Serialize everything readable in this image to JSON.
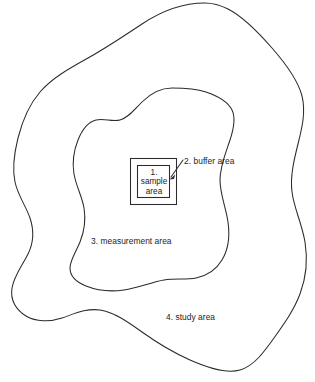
{
  "figure": {
    "type": "nested-areas-schematic",
    "background_color": "#ffffff",
    "line_color": "#2b2b2b",
    "text_color": "#1c1c1c"
  },
  "labels": {
    "sample": {
      "number": "1.",
      "line1": "sample",
      "line2": "area",
      "full": "1. sample area"
    },
    "buffer": {
      "text": "2. buffer area"
    },
    "measurement": {
      "text": "3. measurement area"
    },
    "study": {
      "text": "4. study area"
    }
  },
  "shapes": {
    "outer_blob_name": "study area outline",
    "inner_blob_name": "measurement area outline",
    "outer_square_name": "buffer area square",
    "inner_square_name": "sample area square"
  }
}
